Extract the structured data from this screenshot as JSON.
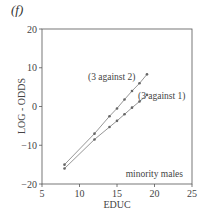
{
  "panel_label": "(f)",
  "chart_data": {
    "type": "line",
    "title": "",
    "panel": "(f)",
    "xlabel": "EDUC",
    "ylabel": "LOG - ODDS",
    "xlim": [
      5,
      25
    ],
    "ylim": [
      -20,
      20
    ],
    "xticks": [
      5,
      10,
      15,
      20,
      25
    ],
    "yticks": [
      -20,
      -10,
      0,
      10,
      20
    ],
    "grid": false,
    "legend": "none",
    "series": [
      {
        "name": "(3 against 2)",
        "x": [
          8,
          12,
          14,
          15,
          16,
          17,
          18,
          19
        ],
        "values": [
          -15,
          -7,
          -2.5,
          -0.5,
          1.8,
          4,
          6,
          8.3
        ]
      },
      {
        "name": "(3 against 1)",
        "x": [
          8,
          12,
          14,
          15,
          16,
          17,
          18,
          19
        ],
        "values": [
          -16,
          -8.5,
          -5.3,
          -3.7,
          -2,
          -0.3,
          1.3,
          3
        ]
      }
    ],
    "annotations": [
      {
        "text": "(3 against 2)",
        "x": 13.5,
        "y": 10
      },
      {
        "text": "(3 against 1)",
        "x": 19.5,
        "y": -1
      },
      {
        "text": "minority males",
        "x": 24,
        "y": -17.5
      }
    ]
  },
  "labels": {
    "xlabel": "EDUC",
    "ylabel": "LOG - ODDS",
    "series1": "(3 against 2)",
    "series2": "(3 against 1)",
    "group": "minority males"
  },
  "ticks": {
    "x": [
      "5",
      "10",
      "15",
      "20",
      "25"
    ],
    "y": [
      "20",
      "10",
      "0",
      "-10",
      "-20"
    ]
  },
  "colors": {
    "line": "#8a8a8a",
    "marker": "#666666",
    "axis": "#555555"
  }
}
